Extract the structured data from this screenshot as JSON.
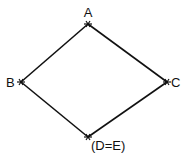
{
  "diagram": {
    "type": "lattice",
    "nodes": [
      {
        "id": "A",
        "label": "A",
        "x": 88,
        "y": 24
      },
      {
        "id": "B",
        "label": "B",
        "x": 21,
        "y": 82
      },
      {
        "id": "C",
        "label": "C",
        "x": 167,
        "y": 82
      },
      {
        "id": "D",
        "label": "(D=E)",
        "x": 88,
        "y": 137
      }
    ],
    "edges": [
      {
        "from": "A",
        "to": "B"
      },
      {
        "from": "A",
        "to": "C"
      },
      {
        "from": "B",
        "to": "D"
      },
      {
        "from": "C",
        "to": "D"
      }
    ]
  }
}
